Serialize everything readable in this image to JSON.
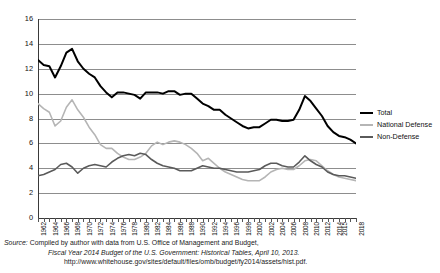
{
  "chart_data": {
    "type": "line",
    "title": "",
    "xlabel": "",
    "ylabel": "",
    "ylim": [
      0,
      16
    ],
    "ytick_step": 2,
    "yticks": [
      "0",
      "2",
      "4",
      "6",
      "8",
      "10",
      "12",
      "14",
      "16"
    ],
    "grid": true,
    "legend_position": "right",
    "x": [
      1962,
      1963,
      1964,
      1965,
      1966,
      1967,
      1968,
      1969,
      1970,
      1971,
      1972,
      1973,
      1974,
      1975,
      1976,
      1977,
      1978,
      1979,
      1980,
      1981,
      1982,
      1983,
      1984,
      1985,
      1986,
      1987,
      1988,
      1989,
      1990,
      1991,
      1992,
      1993,
      1994,
      1995,
      1996,
      1997,
      1998,
      1999,
      2000,
      2001,
      2002,
      2003,
      2004,
      2005,
      2006,
      2007,
      2008,
      2009,
      2010,
      2011,
      2012,
      2013,
      2014,
      2015,
      2016,
      2017,
      2018
    ],
    "xtick_labels": [
      "1962",
      "1964",
      "1966",
      "1968",
      "1970",
      "1972",
      "1974",
      "1976",
      "1978",
      "1980",
      "1982",
      "1984",
      "1986",
      "1988",
      "1990",
      "1992",
      "1994",
      "1996",
      "1998",
      "2000",
      "2002",
      "2004",
      "2006",
      "2008",
      "2010",
      "2012",
      "2014",
      "2015",
      "2018"
    ],
    "series": [
      {
        "name": "Total",
        "color": "#000000",
        "values": [
          12.7,
          12.3,
          12.2,
          11.3,
          12.2,
          13.3,
          13.6,
          12.6,
          12.0,
          11.6,
          11.3,
          10.6,
          10.1,
          9.7,
          10.1,
          10.1,
          10.0,
          9.9,
          9.6,
          10.1,
          10.1,
          10.1,
          10.0,
          10.2,
          10.2,
          9.9,
          10.0,
          10.0,
          9.6,
          9.2,
          9.0,
          8.7,
          8.7,
          8.3,
          8.0,
          7.7,
          7.4,
          7.2,
          7.3,
          7.3,
          7.6,
          7.9,
          7.9,
          7.8,
          7.8,
          7.9,
          8.7,
          9.8,
          9.4,
          8.8,
          8.2,
          7.4,
          6.9,
          6.6,
          6.5,
          6.3,
          6.0
        ]
      },
      {
        "name": "National Defense",
        "color": "#b5b5b5",
        "values": [
          9.2,
          8.8,
          8.5,
          7.4,
          7.8,
          8.9,
          9.5,
          8.7,
          8.1,
          7.3,
          6.7,
          5.9,
          5.6,
          5.6,
          5.2,
          4.9,
          4.7,
          4.7,
          4.9,
          5.2,
          5.8,
          6.1,
          5.9,
          6.1,
          6.2,
          6.1,
          5.9,
          5.6,
          5.2,
          4.6,
          4.8,
          4.4,
          4.0,
          3.7,
          3.5,
          3.3,
          3.1,
          3.0,
          3.0,
          3.0,
          3.3,
          3.7,
          3.9,
          4.0,
          3.9,
          3.9,
          4.2,
          4.6,
          4.7,
          4.6,
          4.2,
          3.8,
          3.5,
          3.3,
          3.2,
          3.1,
          3.0
        ]
      },
      {
        "name": "Non-Defense",
        "color": "#5a5a5a",
        "values": [
          3.4,
          3.5,
          3.7,
          3.9,
          4.3,
          4.4,
          4.1,
          3.6,
          4.0,
          4.2,
          4.3,
          4.2,
          4.1,
          4.5,
          4.8,
          5.0,
          5.1,
          5.0,
          5.2,
          5.1,
          4.7,
          4.4,
          4.2,
          4.1,
          4.0,
          3.8,
          3.8,
          3.8,
          4.0,
          4.2,
          4.1,
          4.0,
          4.0,
          3.9,
          3.8,
          3.7,
          3.7,
          3.7,
          3.8,
          3.9,
          4.2,
          4.4,
          4.4,
          4.2,
          4.1,
          4.1,
          4.5,
          5.0,
          4.6,
          4.3,
          4.1,
          3.7,
          3.5,
          3.4,
          3.4,
          3.3,
          3.2
        ]
      }
    ]
  },
  "legend": {
    "items": [
      {
        "label": "Total",
        "color": "#000000"
      },
      {
        "label": "National Defense",
        "color": "#b5b5b5"
      },
      {
        "label": "Non-Defense",
        "color": "#5a5a5a"
      }
    ]
  },
  "source": {
    "label": "Source:",
    "line1": "Compiled by author with data from U.S. Office of Management and Budget,",
    "line2": "Fiscal Year 2014 Budget of the U.S. Government: Historical Tables, April 10, 2013.",
    "line3": "http://www.whitehouse.gov/sites/default/files/omb/budget/fy2014/assets/hist.pdf."
  }
}
